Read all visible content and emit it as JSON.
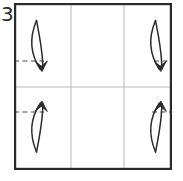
{
  "figure": {
    "kind": "origami-fold-step-diagram",
    "step_number": "3",
    "step_number_label": "3",
    "background_color": "#ffffff",
    "ink_color": "#2b2b2b"
  },
  "paper": {
    "name": "square-sheet",
    "outline_color": "#2b2b2b",
    "outline_width_px": 2.2,
    "x": 14,
    "y": 3,
    "width": 158,
    "height": 167
  },
  "grid": {
    "name": "crease-grid",
    "line_color": "#b9b9b9",
    "line_width_px": 1,
    "columns": 3,
    "rows": 2,
    "vertical_lines_x": [
      71,
      124
    ],
    "horizontal_lines_y": [
      87
    ]
  },
  "reference_lines": [
    {
      "name": "dashed-reference-top-left",
      "x1": 14,
      "y1": 61,
      "x2": 44,
      "y2": 61,
      "style": "dashed",
      "color": "#4a4a4a"
    },
    {
      "name": "dashed-reference-top-right",
      "x1": 154,
      "y1": 61,
      "x2": 172,
      "y2": 61,
      "style": "dashed",
      "color": "#4a4a4a"
    },
    {
      "name": "dashed-reference-bottom-left",
      "x1": 14,
      "y1": 112,
      "x2": 44,
      "y2": 112,
      "style": "dashed",
      "color": "#4a4a4a"
    },
    {
      "name": "dashed-reference-bottom-right",
      "x1": 152,
      "y1": 112,
      "x2": 172,
      "y2": 112,
      "style": "dashed",
      "color": "#4a4a4a"
    }
  ],
  "fold_arrows": [
    {
      "name": "fold-arrow-top-left",
      "direction": "down",
      "cell": "top-left",
      "color": "#2b2b2b",
      "outer_path": "M 36.5 20.5 C 30.0 36.0 28.5 52.0 40.5 69.5",
      "inner_path": "M 36.5 20.5 C 39.5 36.0 43.0 52.0 42.8 69.0",
      "head_path": "M 35.6 62.0 L 41.8 71.2 L 47.2 61.4 L 41.2 66.2 Z"
    },
    {
      "name": "fold-arrow-top-right",
      "direction": "down",
      "cell": "top-right",
      "color": "#2b2b2b",
      "outer_path": "M 155.5 20.5 C 149.0 36.0 147.5 52.0 159.5 69.5",
      "inner_path": "M 155.5 20.5 C 158.5 36.0 162.0 52.0 161.8 69.0",
      "head_path": "M 154.6 62.0 L 160.8 71.2 L 166.2 61.4 L 160.2 66.2 Z"
    },
    {
      "name": "fold-arrow-bottom-left",
      "direction": "up",
      "cell": "bottom-left",
      "color": "#2b2b2b",
      "outer_path": "M 36.5 152.0 C 30.0 136.5 28.5 120.5 40.5 103.0",
      "inner_path": "M 36.5 152.0 C 39.5 136.5 43.0 120.5 42.8 103.5",
      "head_path": "M 35.6 110.5 L 41.8 101.3 L 47.2 111.1 L 41.2 106.3 Z"
    },
    {
      "name": "fold-arrow-bottom-right",
      "direction": "up",
      "cell": "bottom-right",
      "color": "#2b2b2b",
      "outer_path": "M 155.5 152.0 C 149.0 136.5 147.5 120.5 159.5 103.0",
      "inner_path": "M 155.5 152.0 C 158.5 136.5 162.0 120.5 161.8 103.5",
      "head_path": "M 154.6 110.5 L 160.8 101.3 L 166.2 111.1 L 160.2 106.3 Z"
    }
  ],
  "step_number_position": {
    "x": 1,
    "y": 21
  }
}
